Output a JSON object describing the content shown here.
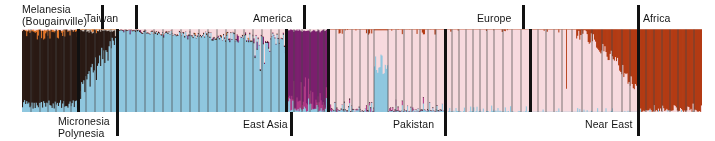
{
  "figure": {
    "type": "structure-admixture-barplot",
    "title": "",
    "background": "#ffffff"
  },
  "labels": {
    "melanesia_line1": "Melanesia",
    "melanesia_line2": "(Bougainville)",
    "taiwan": "Taiwan",
    "america": "America",
    "europe": "Europe",
    "africa": "Africa",
    "micronesia_line1": "Micronesia",
    "micronesia_line2": "Polynesia",
    "east_asia": "East Asia",
    "pakistan": "Pakistan",
    "near_east": "Near East"
  },
  "colors": {
    "melanesia_dark_brown": "#2a1a14",
    "orange": "#e2762a",
    "light_blue": "#8fc7df",
    "purple": "#7b1f6e",
    "magenta": "#b03a86",
    "pink": "#f7dade",
    "rust_red": "#b33b14",
    "white_gap": "#ffffff",
    "divider_black": "#111111",
    "text": "#161616"
  },
  "chart_data": {
    "type": "bar",
    "title": "",
    "xlabel": "",
    "ylabel": "",
    "ylim": [
      0,
      1
    ],
    "grid": false,
    "legend_position": "none",
    "ancestry_components": [
      {
        "name": "Melanesian",
        "color": "#2a1a14"
      },
      {
        "name": "Oceanic-orange",
        "color": "#e2762a"
      },
      {
        "name": "East Asian",
        "color": "#8fc7df"
      },
      {
        "name": "Native American",
        "color": "#7b1f6e"
      },
      {
        "name": "Native American magenta",
        "color": "#b03a86"
      },
      {
        "name": "West Eurasian",
        "color": "#f7dade"
      },
      {
        "name": "African",
        "color": "#b33b14"
      }
    ],
    "axis_px": {
      "plot_left": 22,
      "plot_top": 29,
      "plot_width": 680,
      "plot_height": 83
    },
    "region_dividers_px": [
      78,
      117,
      286,
      328,
      445,
      530,
      638
    ],
    "label_ticks": [
      {
        "label": "Melanesia (Bougainville)",
        "position": "top",
        "x_px": 102
      },
      {
        "label": "Taiwan",
        "position": "top",
        "x_px": 136
      },
      {
        "label": "America",
        "position": "top",
        "x_px": 304
      },
      {
        "label": "Europe",
        "position": "top",
        "x_px": 523
      },
      {
        "label": "Africa",
        "position": "top",
        "x_px": 638
      },
      {
        "label": "Micronesia Polynesia",
        "position": "bottom",
        "x_px": 117
      },
      {
        "label": "East Asia",
        "position": "bottom",
        "x_px": 291
      },
      {
        "label": "Pakistan",
        "position": "bottom",
        "x_px": 445
      },
      {
        "label": "Near East",
        "position": "bottom",
        "x_px": 638
      }
    ],
    "regions": [
      {
        "name": "Melanesia (Bougainville)",
        "x_start_px": 22,
        "x_end_px": 78,
        "dominant_component": "Melanesian",
        "approx_proportions": {
          "Melanesian": 0.83,
          "Oceanic-orange": 0.06,
          "East Asian": 0.1,
          "West Eurasian": 0.01
        }
      },
      {
        "name": "Micronesia / Polynesia",
        "x_start_px": 78,
        "x_end_px": 117,
        "dominant_component": "mixed Melanesian / East Asian",
        "approx_proportions": {
          "Melanesian": 0.42,
          "East Asian": 0.5,
          "Oceanic-orange": 0.04,
          "West Eurasian": 0.04
        }
      },
      {
        "name": "Taiwan / East Asia",
        "x_start_px": 117,
        "x_end_px": 286,
        "dominant_component": "East Asian",
        "approx_proportions": {
          "East Asian": 0.92,
          "West Eurasian": 0.05,
          "Melanesian": 0.02,
          "Native American": 0.01
        }
      },
      {
        "name": "America",
        "x_start_px": 286,
        "x_end_px": 328,
        "dominant_component": "Native American",
        "approx_proportions": {
          "Native American": 0.88,
          "East Asian": 0.08,
          "West Eurasian": 0.04
        }
      },
      {
        "name": "Pakistan",
        "x_start_px": 328,
        "x_end_px": 445,
        "dominant_component": "West Eurasian",
        "approx_proportions": {
          "West Eurasian": 0.88,
          "East Asian": 0.07,
          "African": 0.03,
          "Native American": 0.02
        }
      },
      {
        "name": "Europe",
        "x_start_px": 445,
        "x_end_px": 530,
        "dominant_component": "West Eurasian",
        "approx_proportions": {
          "West Eurasian": 0.96,
          "East Asian": 0.03,
          "African": 0.01
        }
      },
      {
        "name": "Near East",
        "x_start_px": 530,
        "x_end_px": 638,
        "dominant_component": "West Eurasian",
        "approx_proportions": {
          "West Eurasian": 0.87,
          "African": 0.11,
          "East Asian": 0.02
        }
      },
      {
        "name": "Africa",
        "x_start_px": 638,
        "x_end_px": 702,
        "dominant_component": "African",
        "approx_proportions": {
          "African": 0.97,
          "West Eurasian": 0.02,
          "East Asian": 0.01
        }
      }
    ]
  }
}
